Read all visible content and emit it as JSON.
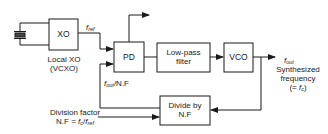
{
  "diagram": {
    "type": "block-diagram",
    "blocks": {
      "xo": {
        "label": "XO"
      },
      "pd": {
        "label": "PD"
      },
      "lpf": {
        "label_line1": "Low-pass",
        "label_line2": "filter"
      },
      "vco": {
        "label": "VCO"
      },
      "divider": {
        "label_line1": "Divide by",
        "label_line2": "N.F"
      }
    },
    "labels": {
      "local_xo_line1": "Local XO",
      "local_xo_line2": "(VCXO)",
      "f_ref_main": "f",
      "f_ref_sub": "ref",
      "f_out_main": "f",
      "f_out_sub": "out",
      "feedback_main": "f",
      "feedback_sub": "out",
      "feedback_suffix": "/N.F",
      "synth_line1": "Synthesized",
      "synth_line2": "frequency",
      "synth_line3_pre": "(= ",
      "synth_line3_f": "f",
      "synth_line3_sub": "c",
      "synth_line3_post": ")",
      "division_line1": "Division factor",
      "division_line2_pre": "N.F = ",
      "division_line2_fc": "f",
      "division_line2_c": "c",
      "division_line2_slash": "/",
      "division_line2_fr": "f",
      "division_line2_ref": "ref"
    },
    "colors": {
      "line": "#1a1a1a",
      "background": "#ffffff"
    }
  }
}
